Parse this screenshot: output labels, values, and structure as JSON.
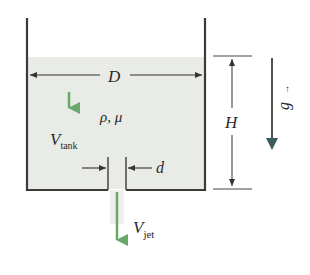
{
  "diagram": {
    "type": "draining-tank-schematic",
    "colors": {
      "background": "#ffffff",
      "water": "#e8ebe6",
      "wall": "#3a3a3a",
      "dimension_line": "#444444",
      "velocity_arrow": "#6aa86a",
      "gravity_arrow_head": "#3b5a5c"
    },
    "labels": {
      "diameter": "D",
      "fluid_props": "ρ, μ",
      "tank_velocity_main": "V",
      "tank_velocity_sub": "tank",
      "hole_diameter": "d",
      "height": "H",
      "gravity": "g",
      "gravity_vector_mark": "→",
      "jet_velocity_main": "V",
      "jet_velocity_sub": "jet"
    },
    "icons": {
      "tank_velocity_arrow": "arrow-down",
      "jet_velocity_arrow": "arrow-down",
      "gravity_arrow": "arrow-down",
      "diameter_dimension": "double-arrow-horizontal",
      "height_dimension": "double-arrow-vertical",
      "hole_dimension": "converging-arrows"
    }
  }
}
